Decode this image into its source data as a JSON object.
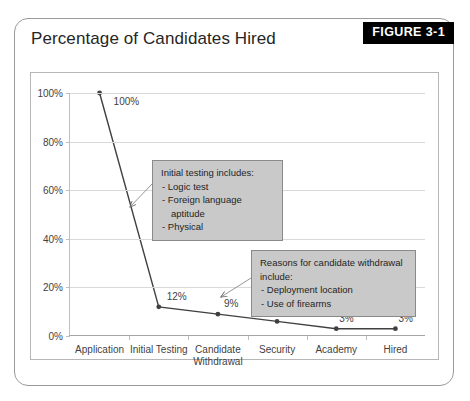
{
  "figure": {
    "title": "Percentage of Candidates Hired",
    "badge_label": "FIGURE 3-1"
  },
  "colors": {
    "badge_background": "#000000",
    "badge_text": "#ffffff",
    "frame_border": "#9a9a9a",
    "plot_border": "#b6b6b6",
    "gridline": "#d9d9d9",
    "series_line": "#404040",
    "callout_fill": "#c9c9c9",
    "callout_border": "#8a8a8a",
    "text": "#3f3f3f"
  },
  "chart_data": {
    "type": "line",
    "title": "Percentage of Candidates Hired",
    "xlabel": "",
    "ylabel": "",
    "ylim": [
      0,
      100
    ],
    "grid": true,
    "legend": "none",
    "categories": [
      "Application",
      "Initial Testing",
      "Candidate\nWithdrawal",
      "Security",
      "Academy",
      "Hired"
    ],
    "values": [
      100,
      12,
      9,
      6,
      3,
      3
    ],
    "data_labels": [
      "100%",
      "12%",
      "9%",
      "6%",
      "3%",
      "3%"
    ],
    "ytick_values": [
      0,
      20,
      40,
      60,
      80,
      100
    ],
    "ytick_labels": [
      "0%",
      "20%",
      "40%",
      "60%",
      "80%",
      "100%"
    ],
    "annotations": [
      {
        "id": "initial-testing-callout",
        "head": "Initial testing includes:",
        "items": [
          "-  Logic test",
          "-  Foreign language aptitude",
          "-  Physical"
        ],
        "points_to": "Application-to-Initial Testing segment"
      },
      {
        "id": "withdrawal-callout",
        "head": "Reasons for candidate withdrawal include:",
        "items": [
          "-  Deployment location",
          "-  Use of firearms"
        ],
        "points_to": "Candidate Withdrawal point"
      }
    ]
  }
}
